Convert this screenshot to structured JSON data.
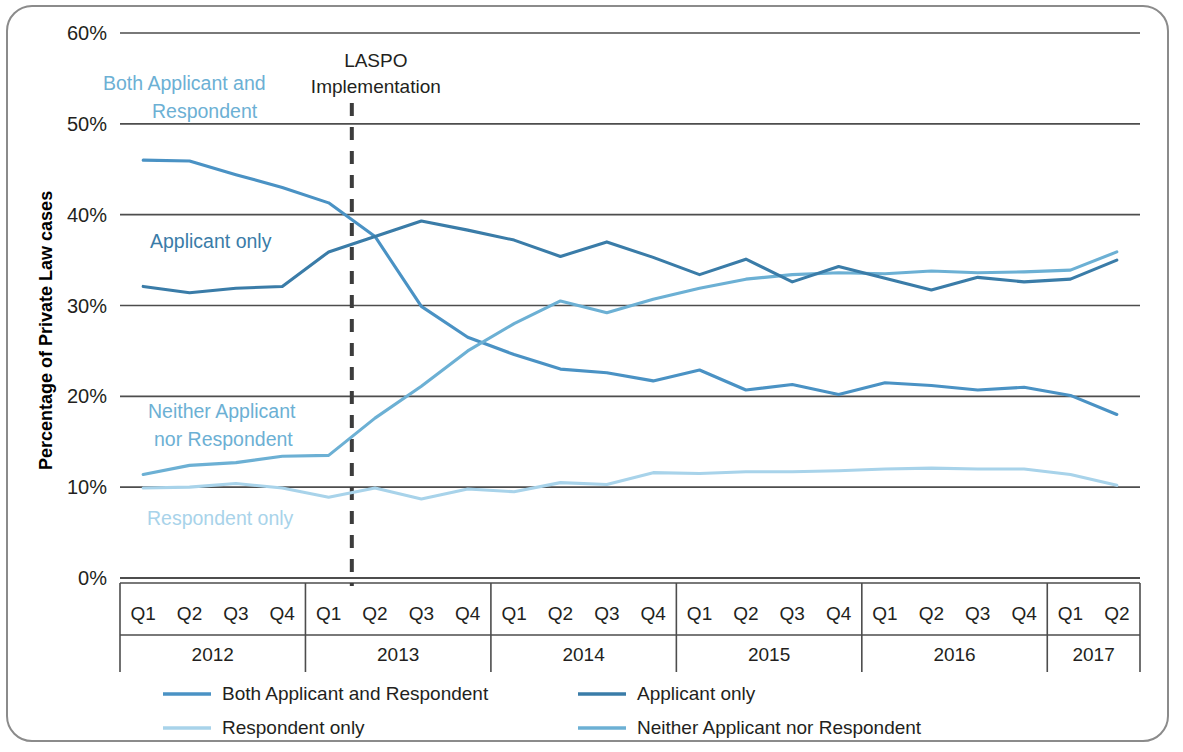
{
  "chart_data": {
    "type": "line",
    "title": "",
    "xlabel": "",
    "ylabel": "Percentage of Private Law cases",
    "ylim": [
      0,
      60
    ],
    "ytick_labels": [
      "0%",
      "10%",
      "20%",
      "30%",
      "40%",
      "50%",
      "60%"
    ],
    "ytick_values": [
      0,
      10,
      20,
      30,
      40,
      50,
      60
    ],
    "grid": true,
    "legend_position": "bottom",
    "x": [
      "2012 Q1",
      "2012 Q2",
      "2012 Q3",
      "2012 Q4",
      "2013 Q1",
      "2013 Q2",
      "2013 Q3",
      "2013 Q4",
      "2014 Q1",
      "2014 Q2",
      "2014 Q3",
      "2014 Q4",
      "2015 Q1",
      "2015 Q2",
      "2015 Q3",
      "2015 Q4",
      "2016 Q1",
      "2016 Q2",
      "2016 Q3",
      "2016 Q4",
      "2017 Q1",
      "2017 Q2"
    ],
    "quarters": [
      "Q1",
      "Q2",
      "Q3",
      "Q4"
    ],
    "years": [
      {
        "label": "2012",
        "quarters": [
          "Q1",
          "Q2",
          "Q3",
          "Q4"
        ]
      },
      {
        "label": "2013",
        "quarters": [
          "Q1",
          "Q2",
          "Q3",
          "Q4"
        ]
      },
      {
        "label": "2014",
        "quarters": [
          "Q1",
          "Q2",
          "Q3",
          "Q4"
        ]
      },
      {
        "label": "2015",
        "quarters": [
          "Q1",
          "Q2",
          "Q3",
          "Q4"
        ]
      },
      {
        "label": "2016",
        "quarters": [
          "Q1",
          "Q2",
          "Q3",
          "Q4"
        ]
      },
      {
        "label": "2017",
        "quarters": [
          "Q1",
          "Q2"
        ]
      }
    ],
    "series": [
      {
        "name": "Both Applicant and Respondent",
        "color": "#4a92c4",
        "values": [
          46.0,
          45.9,
          44.4,
          43.0,
          41.3,
          37.6,
          29.9,
          26.5,
          24.6,
          23.0,
          22.6,
          21.7,
          22.9,
          20.7,
          21.3,
          20.2,
          21.5,
          21.2,
          20.7,
          21.0,
          20.1,
          18.0
        ]
      },
      {
        "name": "Applicant only",
        "color": "#3a7ca8",
        "values": [
          32.1,
          31.4,
          31.9,
          32.1,
          35.9,
          37.6,
          39.3,
          38.3,
          37.2,
          35.4,
          37.0,
          35.3,
          33.4,
          35.1,
          32.6,
          34.3,
          33.0,
          31.7,
          33.1,
          32.6,
          32.9,
          35.0
        ]
      },
      {
        "name": "Respondent only",
        "color": "#a8d3ea",
        "values": [
          9.9,
          10.0,
          10.4,
          9.9,
          8.9,
          9.9,
          8.7,
          9.8,
          9.5,
          10.5,
          10.3,
          11.6,
          11.5,
          11.7,
          11.7,
          11.8,
          12.0,
          12.1,
          12.0,
          12.0,
          11.4,
          10.2
        ]
      },
      {
        "name": "Neither Applicant nor Respondent",
        "color": "#6cb0d4",
        "values": [
          11.4,
          12.4,
          12.7,
          13.4,
          13.5,
          17.6,
          21.1,
          25.0,
          28.0,
          30.5,
          29.2,
          30.7,
          31.9,
          32.9,
          33.4,
          33.6,
          33.5,
          33.8,
          33.6,
          33.7,
          33.9,
          35.9
        ]
      }
    ],
    "annotations": [
      {
        "name": "laspo-implementation",
        "text_line1": "LASPO",
        "text_line2": "Implementation",
        "x_position": "2013 Q2",
        "style": "vertical-dashed-line"
      }
    ],
    "inline_labels": [
      {
        "text_line1": "Both Applicant and",
        "text_line2": "Respondent",
        "color": "#6cb0d4"
      },
      {
        "text_line1": "Applicant only",
        "text_line2": "",
        "color": "#3a7ca8"
      },
      {
        "text_line1": "Neither Applicant",
        "text_line2": "nor Respondent",
        "color": "#6cb0d4"
      },
      {
        "text_line1": "Respondent only",
        "text_line2": "",
        "color": "#a8d3ea"
      }
    ]
  },
  "legend": {
    "items": [
      {
        "label": "Both Applicant and Respondent",
        "color": "#4a92c4"
      },
      {
        "label": "Applicant only",
        "color": "#3a7ca8"
      },
      {
        "label": "Respondent only",
        "color": "#a8d3ea"
      },
      {
        "label": "Neither Applicant nor Respondent",
        "color": "#6cb0d4"
      }
    ]
  },
  "colors": {
    "axis": "#4d4d4d",
    "frame": "#8b8b8b",
    "text": "#231f20",
    "laspo_dash": "#3c3c3c",
    "background": "#ffffff"
  }
}
